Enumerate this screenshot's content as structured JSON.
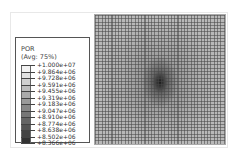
{
  "legend": {
    "variable": "POR",
    "averaging": "(Avg: 75%)",
    "entries": [
      {
        "label": "+1.000e+07",
        "color": "#f2f2f2"
      },
      {
        "label": "+9.864e+06",
        "color": "#e0e0e0"
      },
      {
        "label": "+9.728e+06",
        "color": "#cfcfcf"
      },
      {
        "label": "+9.591e+06",
        "color": "#bdbdbd"
      },
      {
        "label": "+9.455e+06",
        "color": "#ababab"
      },
      {
        "label": "+9.319e+06",
        "color": "#9a9a9a"
      },
      {
        "label": "+9.183e+06",
        "color": "#888888"
      },
      {
        "label": "+9.047e+06",
        "color": "#777777"
      },
      {
        "label": "+8.910e+06",
        "color": "#656565"
      },
      {
        "label": "+8.774e+06",
        "color": "#545454"
      },
      {
        "label": "+8.638e+06",
        "color": "#434343"
      },
      {
        "label": "+8.502e+06",
        "color": "#323232"
      },
      {
        "label": "+8.366e+06",
        "color": "#222222"
      }
    ]
  },
  "viewport": {
    "contour": "pore-pressure-field",
    "min_location": "center"
  }
}
